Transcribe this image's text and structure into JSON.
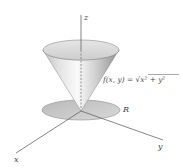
{
  "diagram": {
    "type": "3d-surface",
    "axes": {
      "x_label": "x",
      "y_label": "y",
      "z_label": "z"
    },
    "surface_label": {
      "prefix": "f(x, y) = ",
      "radical": "√",
      "radicand": "x² + y²"
    },
    "region_label": "R",
    "colors": {
      "axis": "#555555",
      "cone_light": "#f4f4f4",
      "cone_dark": "#9a9a9a",
      "disk": "#c8c8c8",
      "text": "#444444"
    }
  }
}
